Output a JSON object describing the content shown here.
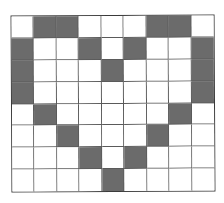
{
  "grid": {
    "rows": 8,
    "cols": 9,
    "fill_color": "#6b6b6b",
    "empty_color": "#ffffff",
    "line_color": "#5a5a5a",
    "filled_cells": [
      [
        0,
        1
      ],
      [
        0,
        2
      ],
      [
        0,
        6
      ],
      [
        0,
        7
      ],
      [
        1,
        0
      ],
      [
        1,
        3
      ],
      [
        1,
        5
      ],
      [
        1,
        8
      ],
      [
        2,
        0
      ],
      [
        2,
        4
      ],
      [
        2,
        8
      ],
      [
        3,
        0
      ],
      [
        3,
        8
      ],
      [
        4,
        1
      ],
      [
        4,
        7
      ],
      [
        5,
        2
      ],
      [
        5,
        6
      ],
      [
        6,
        3
      ],
      [
        6,
        5
      ],
      [
        7,
        4
      ]
    ],
    "pattern": "heart-outline"
  }
}
